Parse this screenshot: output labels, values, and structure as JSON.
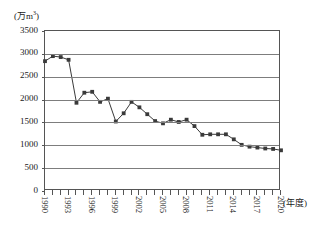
{
  "chart_data": {
    "type": "line",
    "title": "",
    "xlabel": "(年度)",
    "ylabel": "(万m³)",
    "ylim": [
      0,
      3500
    ],
    "ytick_values": [
      0,
      500,
      1000,
      1500,
      2000,
      2500,
      3000,
      3500
    ],
    "ytick_labels": [
      "0",
      "500",
      "1000",
      "1500",
      "2000",
      "2500",
      "3000",
      "3500"
    ],
    "grid": true,
    "legend": "none",
    "marker": "square",
    "series_color": "#3a3a3a",
    "xlim": [
      1990,
      2020
    ],
    "xtick_labels_shown": [
      "1990",
      "1993",
      "1996",
      "1999",
      "2002",
      "2005",
      "2008",
      "2011",
      "2014",
      "2017",
      "2020"
    ],
    "x": [
      1990,
      1991,
      1992,
      1993,
      1994,
      1995,
      1996,
      1997,
      1998,
      1999,
      2000,
      2001,
      2002,
      2003,
      2004,
      2005,
      2006,
      2007,
      2008,
      2009,
      2010,
      2011,
      2012,
      2013,
      2014,
      2015,
      2016,
      2017,
      2018,
      2019,
      2020
    ],
    "values": [
      2840,
      2950,
      2930,
      2870,
      1930,
      2150,
      2170,
      1950,
      2020,
      1520,
      1700,
      1950,
      1830,
      1680,
      1530,
      1480,
      1560,
      1510,
      1560,
      1420,
      1230,
      1240,
      1240,
      1240,
      1130,
      1010,
      970,
      950,
      930,
      920,
      890
    ]
  }
}
